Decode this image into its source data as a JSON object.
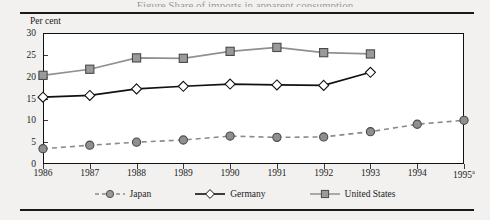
{
  "figure": {
    "title_remnant": "Figure     Share of imports in apparent consumption",
    "y_axis_unit_label": "Per cent",
    "footnote_marker": "a"
  },
  "chart_data": {
    "type": "line",
    "title": "",
    "xlabel": "",
    "ylabel": "Per cent",
    "ylim": [
      0,
      30
    ],
    "yticks": [
      0,
      5,
      10,
      15,
      20,
      25,
      30
    ],
    "grid": false,
    "legend_position": "bottom",
    "categories": [
      "1986",
      "1987",
      "1988",
      "1989",
      "1990",
      "1991",
      "1992",
      "1993",
      "1994",
      "1995"
    ],
    "x_tick_labels": [
      "1986",
      "1987",
      "1988",
      "1989",
      "1990",
      "1991",
      "1992",
      "1993",
      "1994",
      "1995 a"
    ],
    "series": [
      {
        "name": "Japan",
        "marker": "circle",
        "line_style": "dashed",
        "color": "#8a8a8a",
        "marker_fill": "#8f8f8f",
        "values": [
          3.5,
          4.3,
          5.0,
          5.5,
          6.4,
          6.1,
          6.2,
          7.4,
          9.1,
          10.0
        ]
      },
      {
        "name": "Germany",
        "marker": "diamond",
        "line_style": "solid",
        "color": "#111111",
        "marker_fill": "#ffffff",
        "values": [
          15.3,
          15.7,
          17.2,
          17.8,
          18.3,
          18.1,
          18.0,
          21.0,
          null,
          null
        ]
      },
      {
        "name": "United States",
        "marker": "square",
        "line_style": "solid",
        "color": "#909090",
        "marker_fill": "#9a9a9a",
        "values": [
          20.3,
          21.7,
          24.3,
          24.2,
          25.8,
          26.7,
          25.5,
          25.2,
          null,
          null
        ]
      }
    ]
  },
  "legend": {
    "items": [
      {
        "label": "Japan"
      },
      {
        "label": "Germany"
      },
      {
        "label": "United States"
      }
    ]
  }
}
